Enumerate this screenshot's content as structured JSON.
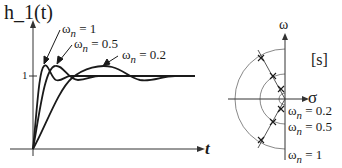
{
  "step_plot": {
    "ylabel": "h_1(t)",
    "xlabel": "t",
    "level_label": "1",
    "curves": [
      {
        "label_prefix": "ω",
        "label_sub": "n",
        "label_value": " = 1"
      },
      {
        "label_prefix": "ω",
        "label_sub": "n",
        "label_value": " = 0.5"
      },
      {
        "label_prefix": "ω",
        "label_sub": "n",
        "label_value": " = 0.2"
      }
    ]
  },
  "s_plane": {
    "vertical_axis_label": "ω",
    "horizontal_axis_label": "σ",
    "plane_label": "[s]",
    "circles": [
      {
        "prefix": "ω",
        "sub": "n",
        "value": " = 0.2"
      },
      {
        "prefix": "ω",
        "sub": "n",
        "value": " = 0.5"
      },
      {
        "prefix": "ω",
        "sub": "n",
        "value": " = 1"
      }
    ]
  },
  "colors": {
    "curve": "#1a1a1a",
    "axis": "#333333",
    "circle": "#7a7a7a"
  }
}
